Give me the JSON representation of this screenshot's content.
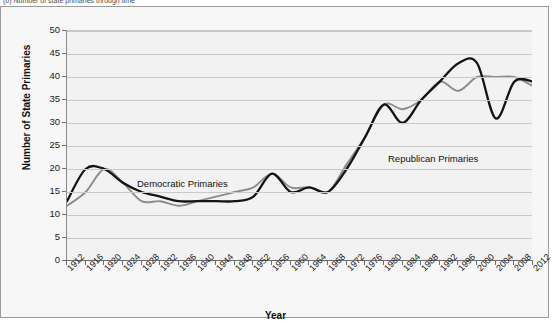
{
  "caption": "(b) Number of state primaries through time",
  "axis": {
    "x_title": "Year",
    "y_title": "Number of State Primaries"
  },
  "labels": {
    "democratic": "Democratic Primaries",
    "republican": "Republican Primaries"
  },
  "colors": {
    "republican": "#141414",
    "democratic": "#8c8c8c",
    "grid": "#c9c9c9",
    "plot_background": "#f2f2f2",
    "frame_background": "#f7f7f7"
  },
  "chart_data": {
    "type": "line",
    "title": "",
    "xlabel": "Year",
    "ylabel": "Number of State Primaries",
    "xlim": [
      1912,
      2012
    ],
    "ylim": [
      0,
      50
    ],
    "ytick_step": 5,
    "xtick_step": 4,
    "grid": true,
    "legend_position": "inline-annotations",
    "x": [
      1912,
      1916,
      1920,
      1924,
      1928,
      1932,
      1936,
      1940,
      1944,
      1948,
      1952,
      1956,
      1960,
      1964,
      1968,
      1972,
      1976,
      1980,
      1984,
      1988,
      1992,
      1996,
      2000,
      2004,
      2008,
      2012
    ],
    "yticks": [
      0,
      5,
      10,
      15,
      20,
      25,
      30,
      35,
      40,
      45,
      50
    ],
    "series": [
      {
        "name": "Republican Primaries",
        "color": "#141414",
        "values": [
          13,
          20,
          20,
          17,
          15,
          14,
          13,
          13,
          13,
          13,
          14,
          19,
          15,
          16,
          15,
          20,
          27,
          34,
          30,
          35,
          39,
          43,
          43,
          31,
          39,
          39
        ]
      },
      {
        "name": "Democratic Primaries",
        "color": "#8c8c8c",
        "values": [
          12,
          15,
          20,
          17,
          13,
          13,
          12,
          13,
          14,
          15,
          16,
          19,
          16,
          16,
          15,
          21,
          27,
          34,
          33,
          35,
          39,
          37,
          40,
          40,
          40,
          38
        ]
      }
    ]
  }
}
